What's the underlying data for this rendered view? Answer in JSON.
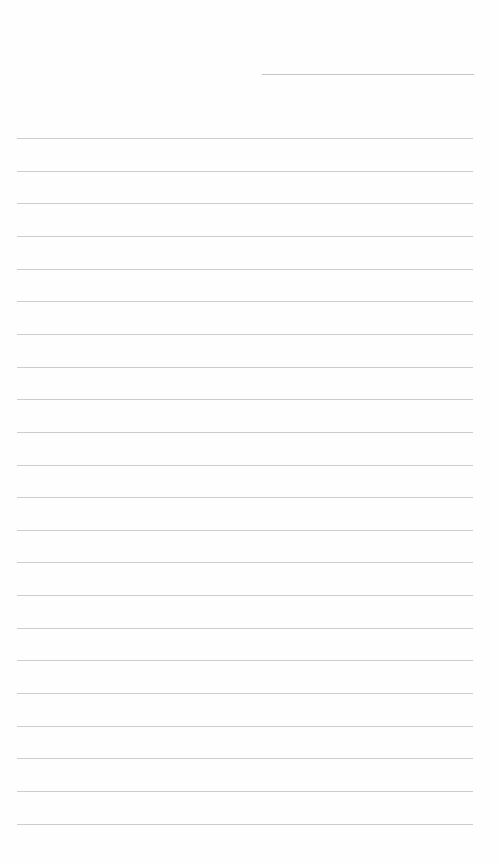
{
  "page": {
    "type": "ruled-notepaper",
    "background": "#fefefe",
    "line_color": "#cdcdcd",
    "date_field": {
      "value": ""
    },
    "ruled_lines": {
      "count": 22,
      "first_y": 138,
      "spacing": 32.65,
      "left": 17,
      "width": 456
    },
    "lines": [
      "",
      "",
      "",
      "",
      "",
      "",
      "",
      "",
      "",
      "",
      "",
      "",
      "",
      "",
      "",
      "",
      "",
      "",
      "",
      "",
      "",
      ""
    ]
  }
}
